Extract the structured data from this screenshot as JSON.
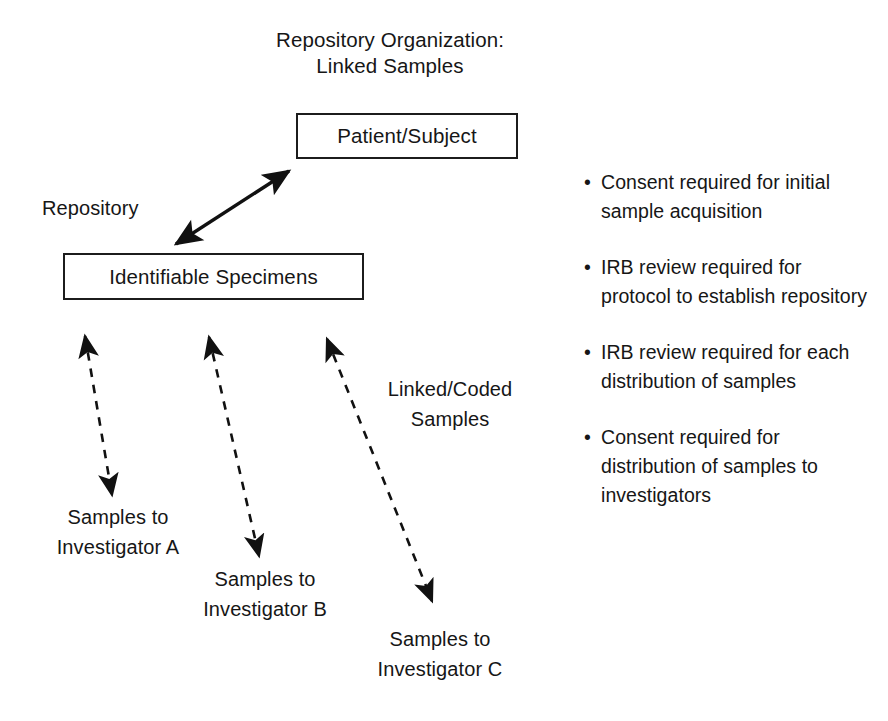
{
  "title": {
    "line1": "Repository Organization:",
    "line2": "Linked Samples"
  },
  "nodes": {
    "patient_subject": "Patient/Subject",
    "identifiable_specimens": "Identifiable Specimens"
  },
  "labels": {
    "repository": "Repository",
    "linked_coded_line1": "Linked/Coded",
    "linked_coded_line2": "Samples",
    "investigator_a_line1": "Samples to",
    "investigator_a_line2": "Investigator A",
    "investigator_b_line1": "Samples to",
    "investigator_b_line2": "Investigator B",
    "investigator_c_line1": "Samples to",
    "investigator_c_line2": "Investigator C"
  },
  "notes": {
    "bullet_glyph": "•",
    "items": [
      "Consent required for initial sample acquisition",
      "IRB review required for protocol to establish repository",
      "IRB review required for each distribution of samples",
      "Consent required for distribution of samples to investigators"
    ]
  },
  "colors": {
    "background": "#ffffff",
    "ink": "#161616",
    "stroke": "#1c1c1c"
  },
  "connectors": [
    {
      "name": "patient-to-specimens",
      "style": "solid",
      "heads": "both",
      "from": [
        172,
        247
      ],
      "to": [
        293,
        168
      ]
    },
    {
      "name": "specimens-to-investigator-a",
      "style": "dashed",
      "heads": "both",
      "from": [
        82,
        330
      ],
      "to": [
        114,
        501
      ]
    },
    {
      "name": "specimens-to-investigator-b",
      "style": "dashed",
      "heads": "both",
      "from": [
        206,
        331
      ],
      "to": [
        262,
        562
      ]
    },
    {
      "name": "specimens-to-investigator-c",
      "style": "dashed",
      "heads": "both",
      "from": [
        323,
        333
      ],
      "to": [
        436,
        607
      ]
    }
  ]
}
